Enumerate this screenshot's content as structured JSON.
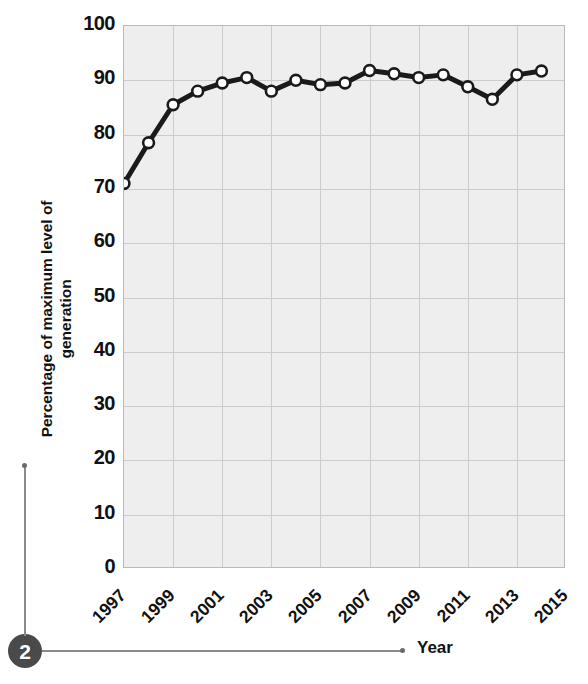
{
  "chart_data": {
    "type": "line",
    "title": "",
    "subtitle": "",
    "xlabel": "Year",
    "ylabel": "Percentage of maximum level of generation",
    "x": [
      1997,
      1998,
      1999,
      2000,
      2001,
      2002,
      2003,
      2004,
      2005,
      2006,
      2007,
      2008,
      2009,
      2010,
      2011,
      2012,
      2013,
      2014
    ],
    "values": [
      71,
      78.5,
      85.5,
      88,
      89.5,
      90.5,
      88,
      90,
      89.2,
      89.5,
      91.8,
      91.2,
      90.5,
      91,
      88.8,
      86.5,
      91,
      91.7
    ],
    "series": [
      {
        "name": "Percentage of maximum level of generation",
        "values": [
          71,
          78.5,
          85.5,
          88,
          89.5,
          90.5,
          88,
          90,
          89.2,
          89.5,
          91.8,
          91.2,
          90.5,
          91,
          88.8,
          86.5,
          91,
          91.7
        ]
      }
    ],
    "ylim": [
      0,
      100
    ],
    "xlim": [
      1997,
      2015
    ],
    "ytick_labels": [
      "0",
      "10",
      "20",
      "30",
      "40",
      "50",
      "60",
      "70",
      "80",
      "90",
      "100"
    ],
    "ytick_values": [
      0,
      10,
      20,
      30,
      40,
      50,
      60,
      70,
      80,
      90,
      100
    ],
    "xtick_labels": [
      "1997",
      "1999",
      "2001",
      "2003",
      "2005",
      "2007",
      "2009",
      "2011",
      "2013",
      "2015"
    ],
    "xtick_values": [
      1997,
      1999,
      2001,
      2003,
      2005,
      2007,
      2009,
      2011,
      2013,
      2015
    ],
    "grid": true,
    "legend": "none",
    "marker": "circle-open",
    "line_color": "#1a1a1a",
    "marker_fill": "#ffffff",
    "marker_edge": "#1a1a1a",
    "plot_background": "#eeeeee",
    "grid_color": "#cccccc"
  },
  "axes": {
    "y_label": "Percentage of maximum level of\ngeneration",
    "y_label_line1": "Percentage of maximum level of",
    "y_label_line2": "generation",
    "x_label": "Year"
  },
  "annotations": {
    "callout_number": "2"
  }
}
